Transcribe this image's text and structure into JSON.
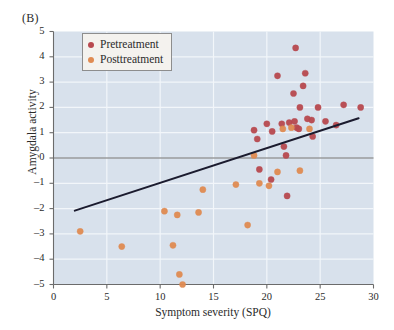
{
  "panel": {
    "label": "(B)"
  },
  "legend": {
    "entries": [
      {
        "name": "Pretreatment",
        "color": "#b8494f"
      },
      {
        "name": "Posttreatment",
        "color": "#e08b52"
      }
    ]
  },
  "colors": {
    "plot_background": "#d8e1ec",
    "gridline": "#f2f6fa",
    "axis": "#6b6b6b",
    "zero_line": "#6f6f6f",
    "trend_line": "#1b1b2e",
    "pretreatment": "#b8494f",
    "posttreatment": "#e08b52",
    "legend_background": "#f4f2ee",
    "legend_border": "#8d8d8d",
    "text": "#2b2b2b"
  },
  "chart_data": {
    "type": "scatter",
    "title": "(B)",
    "xlabel": "Symptom severity (SPQ)",
    "ylabel": "Amygdala activity",
    "xlim": [
      0,
      30
    ],
    "ylim": [
      -5,
      5
    ],
    "xticks": [
      0,
      5,
      10,
      15,
      20,
      25,
      30
    ],
    "yticks": [
      -5,
      -4,
      -3,
      -2,
      -1,
      0,
      1,
      2,
      3,
      4,
      5
    ],
    "grid": true,
    "legend_position": "top-left-inside",
    "zero_line": {
      "y": 0,
      "color": "#6f6f6f"
    },
    "trend_line": {
      "label": "regression line",
      "x": [
        2.0,
        28.6
      ],
      "y": [
        -2.08,
        1.57
      ]
    },
    "series": [
      {
        "name": "Pretreatment",
        "color": "#b8494f",
        "points": [
          [
            18.8,
            1.1
          ],
          [
            19.1,
            0.75
          ],
          [
            19.3,
            -0.45
          ],
          [
            20.0,
            1.35
          ],
          [
            20.4,
            -0.85
          ],
          [
            20.5,
            1.05
          ],
          [
            21.0,
            3.25
          ],
          [
            21.4,
            1.35
          ],
          [
            21.6,
            0.45
          ],
          [
            21.8,
            0.1
          ],
          [
            21.9,
            -1.5
          ],
          [
            22.1,
            1.4
          ],
          [
            22.5,
            2.55
          ],
          [
            22.6,
            1.45
          ],
          [
            22.7,
            4.35
          ],
          [
            22.8,
            1.2
          ],
          [
            23.0,
            1.15
          ],
          [
            23.1,
            2.0
          ],
          [
            23.4,
            2.85
          ],
          [
            23.6,
            3.35
          ],
          [
            23.8,
            1.55
          ],
          [
            24.2,
            1.5
          ],
          [
            24.3,
            0.85
          ],
          [
            24.8,
            2.0
          ],
          [
            25.5,
            1.45
          ],
          [
            26.5,
            1.3
          ],
          [
            27.2,
            2.1
          ],
          [
            28.8,
            2.0
          ]
        ]
      },
      {
        "name": "Posttreatment",
        "color": "#e08b52",
        "points": [
          [
            2.5,
            -2.9
          ],
          [
            6.4,
            -3.5
          ],
          [
            10.4,
            -2.1
          ],
          [
            11.2,
            -3.45
          ],
          [
            11.6,
            -2.25
          ],
          [
            11.8,
            -4.6
          ],
          [
            12.1,
            -5.0
          ],
          [
            13.6,
            -2.15
          ],
          [
            14.0,
            -1.25
          ],
          [
            17.1,
            -1.05
          ],
          [
            18.2,
            -2.65
          ],
          [
            18.8,
            0.1
          ],
          [
            19.3,
            -1.0
          ],
          [
            20.2,
            -1.1
          ],
          [
            21.0,
            -0.55
          ],
          [
            21.5,
            1.15
          ],
          [
            22.3,
            1.2
          ],
          [
            23.1,
            -0.5
          ],
          [
            24.0,
            1.15
          ]
        ]
      }
    ]
  }
}
